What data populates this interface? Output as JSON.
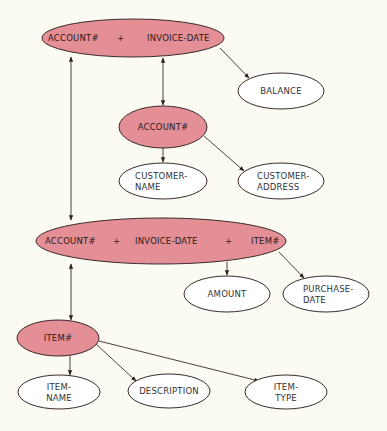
{
  "diagram": {
    "colors": {
      "background": "#fbfaf3",
      "key_fill": "#e48e95",
      "attr_fill": "#ffffff",
      "stroke": "#3a2a2a"
    },
    "nodes": [
      {
        "id": "n1",
        "type": "key",
        "parts": [
          "ACCOUNT#",
          "+",
          "INVOICE-DATE"
        ]
      },
      {
        "id": "n2",
        "type": "attribute",
        "lines": [
          "BALANCE"
        ]
      },
      {
        "id": "n3",
        "type": "key",
        "parts": [
          "ACCOUNT#"
        ]
      },
      {
        "id": "n4",
        "type": "attribute",
        "lines": [
          "CUSTOMER-",
          "NAME"
        ]
      },
      {
        "id": "n5",
        "type": "attribute",
        "lines": [
          "CUSTOMER-",
          "ADDRESS"
        ]
      },
      {
        "id": "n6",
        "type": "key",
        "parts": [
          "ACCOUNT#",
          "+",
          "INVOICE-DATE",
          "+",
          "ITEM#"
        ]
      },
      {
        "id": "n7",
        "type": "attribute",
        "lines": [
          "AMOUNT"
        ]
      },
      {
        "id": "n8",
        "type": "attribute",
        "lines": [
          "PURCHASE-",
          "DATE"
        ]
      },
      {
        "id": "n9",
        "type": "key",
        "parts": [
          "ITEM#"
        ]
      },
      {
        "id": "n10",
        "type": "attribute",
        "lines": [
          "ITEM-",
          "NAME"
        ]
      },
      {
        "id": "n11",
        "type": "attribute",
        "lines": [
          "DESCRIPTION"
        ]
      },
      {
        "id": "n12",
        "type": "attribute",
        "lines": [
          "ITEM-",
          "TYPE"
        ]
      }
    ],
    "edges": [
      {
        "from": "n1",
        "to": "n2",
        "style": "single"
      },
      {
        "from": "n1",
        "to": "n3",
        "style": "double"
      },
      {
        "from": "n3",
        "to": "n4",
        "style": "single"
      },
      {
        "from": "n3",
        "to": "n5",
        "style": "single"
      },
      {
        "from": "n1",
        "to": "n6",
        "style": "double"
      },
      {
        "from": "n6",
        "to": "n7",
        "style": "single"
      },
      {
        "from": "n6",
        "to": "n8",
        "style": "single"
      },
      {
        "from": "n6",
        "to": "n9",
        "style": "double"
      },
      {
        "from": "n9",
        "to": "n10",
        "style": "single"
      },
      {
        "from": "n9",
        "to": "n11",
        "style": "single"
      },
      {
        "from": "n9",
        "to": "n12",
        "style": "single"
      }
    ]
  }
}
